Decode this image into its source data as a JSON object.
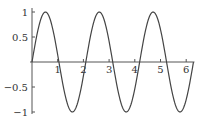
{
  "chart_data": {
    "type": "line",
    "title": "",
    "xlabel": "",
    "ylabel": "",
    "function": "sin(3x)",
    "xlim": [
      0,
      6.283
    ],
    "ylim": [
      -1,
      1
    ],
    "grid": false,
    "legend": null,
    "x_ticks": [
      1,
      2,
      3,
      4,
      5,
      6
    ],
    "x_tick_labels": [
      "1",
      "2",
      "3",
      "4",
      "5",
      "6"
    ],
    "y_ticks": [
      1,
      0.5,
      -0.5,
      -1
    ],
    "y_tick_labels": [
      "1",
      "0.5",
      "-0.5",
      "-1"
    ],
    "series": [
      {
        "name": "sin(3x)",
        "x": [
          0,
          0.5236,
          1.0472,
          1.5708,
          2.0944,
          2.618,
          3.1416,
          3.6652,
          4.1888,
          4.7124,
          5.236,
          5.7596,
          6.2832
        ],
        "y": [
          0,
          1,
          0,
          -1,
          0,
          1,
          0,
          -1,
          0,
          1,
          0,
          -1,
          0
        ]
      }
    ],
    "colors": {
      "curve": "#444444",
      "axis": "#555555",
      "text": "#333333"
    }
  }
}
